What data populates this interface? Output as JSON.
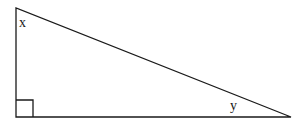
{
  "figure": {
    "name": "right-triangle-with-labeled-acute-angles",
    "type": "geometry-diagram",
    "background_color": "#ffffff",
    "stroke_color": "#1a1a1a",
    "stroke_width": 1.3,
    "canvas": {
      "width": 301,
      "height": 124
    },
    "shape": {
      "kind": "right-triangle",
      "vertices": {
        "top_left": {
          "x": 16,
          "y": 8
        },
        "bottom_left": {
          "x": 16,
          "y": 117
        },
        "bottom_right": {
          "x": 291,
          "y": 117
        }
      },
      "points_attr": "16,8 16,117 291,117",
      "sides": {
        "vertical_leg": {
          "from": "top_left",
          "to": "bottom_left",
          "length_px": 109
        },
        "horizontal_leg": {
          "from": "bottom_left",
          "to": "bottom_right",
          "length_px": 275
        },
        "hypotenuse": {
          "from": "top_left",
          "to": "bottom_right",
          "length_px": 296
        }
      }
    },
    "right_angle_marker": {
      "name": "right-angle-square",
      "at_vertex": "bottom_left",
      "size_px": 17,
      "points_attr": "33,117 33,100 16,100"
    },
    "labels": [
      {
        "name": "angle-label-x",
        "text": "x",
        "at_vertex": "top_left",
        "x": 19,
        "y": 16
      },
      {
        "name": "angle-label-y",
        "text": "y",
        "at_vertex": "bottom_right",
        "x": 230,
        "y": 99
      }
    ]
  }
}
